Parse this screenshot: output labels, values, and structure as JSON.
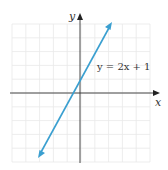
{
  "chart_data": {
    "type": "line",
    "title": "",
    "xlabel": "x",
    "ylabel": "y",
    "grid": true,
    "series": [
      {
        "name": "y = 2x + 1",
        "equation": "y = 2x + 1",
        "slope": 2,
        "intercept": 1,
        "x": [
          -4,
          4
        ],
        "y": [
          -7,
          9
        ],
        "color": "#3a9fd0",
        "arrows_both_ends": true
      }
    ],
    "annotations": [
      {
        "text": "y = 2x + 1",
        "position": "upper-right of y-axis"
      }
    ],
    "xlim": [
      -8.5,
      8.5
    ],
    "ylim": [
      -8.5,
      8.5
    ],
    "legend": "none"
  },
  "labels": {
    "x_axis": "x",
    "y_axis": "y",
    "equation": "y = 2x + 1"
  },
  "colors": {
    "line": "#3a9fd0",
    "axis": "#333333",
    "grid": "#e6e6e6"
  }
}
